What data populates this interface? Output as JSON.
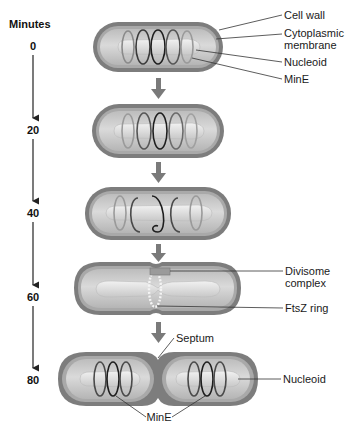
{
  "figure": {
    "axis": {
      "title": "Minutes",
      "ticks": [
        "0",
        "20",
        "40",
        "60",
        "80"
      ]
    },
    "stages": [
      {
        "time": "0",
        "labels": [
          "Cell wall",
          "Cytoplasmic",
          "membrane",
          "Nucleoid",
          "MinE"
        ]
      },
      {
        "time": "20",
        "labels": []
      },
      {
        "time": "40",
        "labels": []
      },
      {
        "time": "60",
        "labels": [
          "Divisome",
          "complex",
          "FtsZ ring"
        ]
      },
      {
        "time": "80",
        "labels": [
          "Septum",
          "Nucleoid",
          "MinE"
        ]
      }
    ],
    "colors": {
      "cell_wall": "#7d7d7d",
      "membrane": "#a9a9a9",
      "cytoplasm": "#cfcfcf",
      "nucleoid": "#e3e3e3",
      "mine_coil_dark": "#2a2a2a",
      "mine_coil_light": "#8a8a8a",
      "stage_arrow": "#7a7a7a",
      "timeline": "#222222"
    }
  }
}
